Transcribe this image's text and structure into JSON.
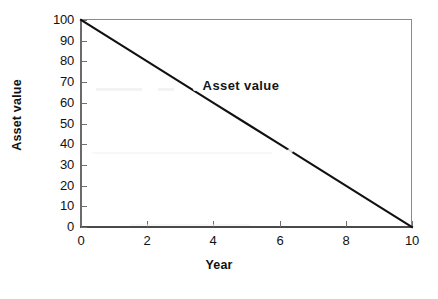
{
  "chart_data": {
    "type": "line",
    "title": "",
    "subtitle": "",
    "xlabel": "Year",
    "ylabel": "Asset value",
    "xlim": [
      0,
      10
    ],
    "ylim": [
      0,
      100
    ],
    "grid": false,
    "legend_position": "none",
    "annotations": [
      {
        "text": "Asset value",
        "x": 6.0,
        "y": 68
      }
    ],
    "xticks": [
      0,
      2,
      4,
      6,
      8,
      10
    ],
    "xtick_labels": [
      "0",
      "2",
      "4",
      "6",
      "8",
      "10"
    ],
    "yticks": [
      0,
      10,
      20,
      30,
      40,
      50,
      60,
      70,
      80,
      90,
      100
    ],
    "ytick_labels": [
      "0",
      "10",
      "20",
      "30",
      "40",
      "50",
      "60",
      "70",
      "80",
      "90",
      "100"
    ],
    "series": [
      {
        "name": "Asset value",
        "color": "#111111",
        "x": [
          0,
          1,
          2,
          3,
          4,
          5,
          6,
          7,
          8,
          9,
          10
        ],
        "values": [
          100,
          90,
          80,
          70,
          60,
          50,
          40,
          30,
          20,
          10,
          0
        ]
      }
    ]
  },
  "colors": {
    "line": "#111111",
    "axis": "#6f6f6f",
    "frame": "#8a8a8a",
    "text": "#111111",
    "background": "#ffffff"
  }
}
